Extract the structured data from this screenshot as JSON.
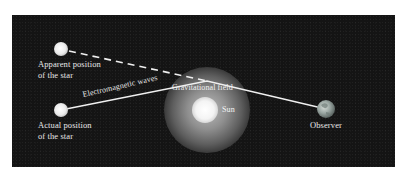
{
  "diagram": {
    "background_color": "#141414",
    "labels": {
      "apparent_star": "Apparent position\nof the star",
      "actual_star": "Actual position\nof the star",
      "em_waves": "Electromagnetic waves",
      "gravitational_field": "Gravitational field",
      "sun": "Sun",
      "observer": "Observer"
    },
    "elements": {
      "apparent_star": {
        "x": 61,
        "y": 49,
        "r": 7,
        "color": "#f2f2f2"
      },
      "actual_star": {
        "x": 61,
        "y": 110,
        "r": 7,
        "color": "#f2f2f2"
      },
      "bend_point": {
        "x": 207,
        "y": 81
      },
      "sun": {
        "x": 205,
        "y": 110,
        "r": 13,
        "color": "#ffffff"
      },
      "gravitational_field": {
        "x": 207,
        "y": 110,
        "r": 43,
        "color": "#9a9a9a"
      },
      "observer": {
        "x": 326,
        "y": 109,
        "r": 9,
        "color": "#8a9a96"
      }
    },
    "lines": {
      "light_path": {
        "style": "solid",
        "color": "#f0f0f0",
        "points": "actual_star -> bend_point -> observer"
      },
      "apparent_line": {
        "style": "dashed",
        "color": "#f0f0f0",
        "points": "apparent_star -> bend_point"
      }
    }
  }
}
